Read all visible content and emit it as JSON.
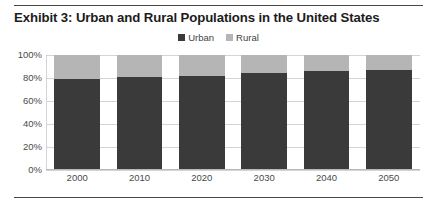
{
  "exhibit": {
    "title": "Exhibit 3: Urban and Rural Populations in the United States"
  },
  "legend": {
    "position": "top-center",
    "items": [
      {
        "label": "Urban",
        "color": "#3a3a3a",
        "icon": "square-marker-icon"
      },
      {
        "label": "Rural",
        "color": "#b5b5b5",
        "icon": "square-marker-icon"
      }
    ]
  },
  "axes": {
    "y_ticks": [
      "100%",
      "80%",
      "60%",
      "40%",
      "20%",
      "0%"
    ],
    "x_ticks": [
      "2000",
      "2010",
      "2020",
      "2030",
      "2040",
      "2050"
    ]
  },
  "chart_data": {
    "type": "bar",
    "stacked": true,
    "title": "Exhibit 3: Urban and Rural Populations in the United States",
    "xlabel": "",
    "ylabel": "",
    "categories": [
      "2000",
      "2010",
      "2020",
      "2030",
      "2040",
      "2050"
    ],
    "series": [
      {
        "name": "Urban",
        "color": "#3a3a3a",
        "values": [
          79,
          81,
          82,
          84,
          86,
          87
        ]
      },
      {
        "name": "Rural",
        "color": "#b5b5b5",
        "values": [
          21,
          19,
          18,
          16,
          14,
          13
        ]
      }
    ],
    "ylim": [
      0,
      100
    ],
    "ytick_values": [
      0,
      20,
      40,
      60,
      80,
      100
    ],
    "ytick_labels": [
      "0%",
      "20%",
      "40%",
      "60%",
      "80%",
      "100%"
    ],
    "grid": true,
    "grid_axis": "y",
    "legend_position": "top-center",
    "value_unit": "percent",
    "annotations": []
  },
  "style": {
    "background": "#ffffff",
    "text_color": "#1c1c1c",
    "tick_color": "#4a4a4a",
    "grid_color": "#d4d4d4",
    "rule_color": "#4a4a4a"
  }
}
